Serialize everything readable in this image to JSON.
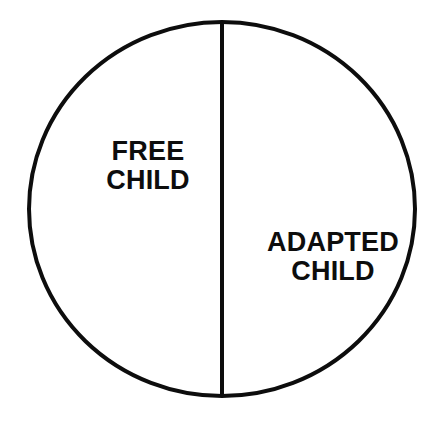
{
  "diagram": {
    "type": "split-circle",
    "background_color": "#ffffff",
    "stroke_color": "#0d0d0d",
    "fill_color": "none",
    "stroke_width": 4,
    "shape": {
      "name": "ellipse",
      "center_x": 222,
      "center_y": 209,
      "radius_x": 195,
      "radius_y": 189
    },
    "divider": {
      "name": "vertical-divider",
      "orientation": "vertical",
      "x": 222,
      "y_start": 20,
      "y_end": 398
    },
    "segments": [
      {
        "id": "free-child",
        "side": "left",
        "line1": "FREE",
        "line2": "CHILD",
        "text_color": "#0d0d0d"
      },
      {
        "id": "adapted-child",
        "side": "right",
        "line1": "ADAPTED",
        "line2": "CHILD",
        "text_color": "#0d0d0d"
      }
    ]
  }
}
